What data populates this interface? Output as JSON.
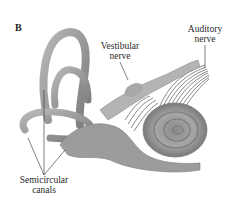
{
  "figure": {
    "panel_letter": "B",
    "labels": {
      "vestibular_nerve": [
        "Vestibular",
        "nerve"
      ],
      "auditory_nerve": [
        "Auditory",
        "nerve"
      ],
      "semicircular_canals": [
        "Semicircular",
        "canals"
      ]
    },
    "colors": {
      "structure_fill": "#9a9a9a",
      "structure_dark": "#6e6e6e",
      "structure_light": "#c4c4c4",
      "leader_line": "#2a2a2a",
      "text": "#2a2a2a"
    }
  }
}
